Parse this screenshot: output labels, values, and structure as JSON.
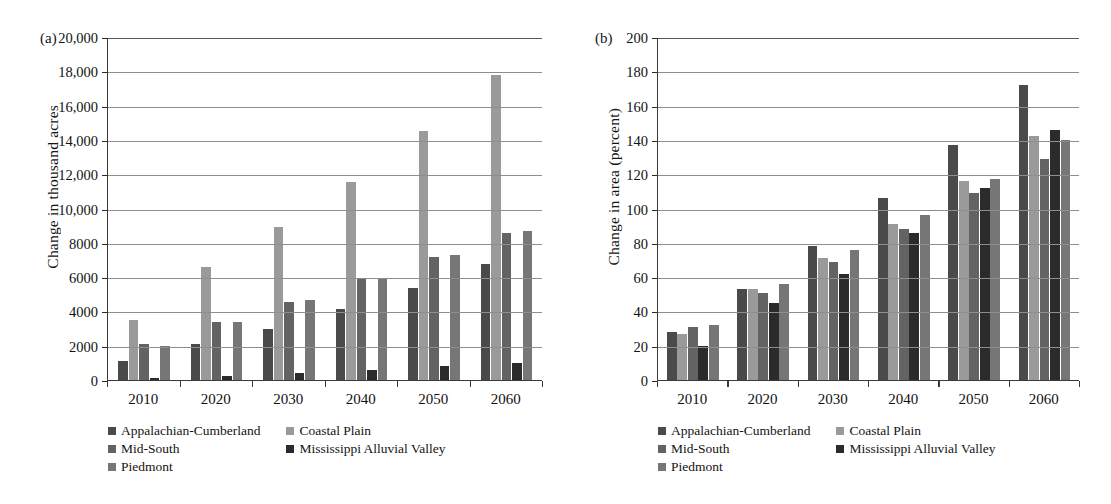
{
  "figure": {
    "background": "#ffffff",
    "series_colors": [
      "#4a4a4a",
      "#9a9a9a",
      "#636363",
      "#2b2b2b",
      "#767676"
    ],
    "series_names": [
      "Appalachian-Cumberland",
      "Coastal Plain",
      "Mid-South",
      "Mississippi Alluvial Valley",
      "Piedmont"
    ]
  },
  "legend": {
    "items": [
      {
        "label": "Appalachian-Cumberland",
        "color": "#4a4a4a"
      },
      {
        "label": "Coastal Plain",
        "color": "#9a9a9a"
      },
      {
        "label": "Mid-South",
        "color": "#636363"
      },
      {
        "label": "Mississippi Alluvial Valley",
        "color": "#2b2b2b"
      },
      {
        "label": "Piedmont",
        "color": "#767676"
      }
    ]
  },
  "chart_data": [
    {
      "panel": "(a)",
      "type": "bar",
      "title": "",
      "xlabel": "",
      "ylabel": "Change in thousand acres",
      "categories": [
        "2010",
        "2020",
        "2030",
        "2040",
        "2050",
        "2060"
      ],
      "ylim": [
        0,
        20000
      ],
      "yticks": [
        0,
        2000,
        4000,
        6000,
        8000,
        10000,
        12000,
        14000,
        16000,
        18000,
        20000
      ],
      "ytick_labels": [
        "0",
        "2000",
        "4000",
        "6000",
        "8000",
        "10,000",
        "12,000",
        "14,000",
        "16,000",
        "18,000",
        "20,000"
      ],
      "grid": true,
      "legend_position": "below",
      "series": [
        {
          "name": "Appalachian-Cumberland",
          "color": "#4a4a4a",
          "values": [
            1100,
            2080,
            3000,
            4150,
            5350,
            6750
          ]
        },
        {
          "name": "Coastal Plain",
          "color": "#9a9a9a",
          "values": [
            3500,
            6600,
            8950,
            11550,
            14500,
            17800
          ]
        },
        {
          "name": "Mid-South",
          "color": "#636363",
          "values": [
            2100,
            3400,
            4550,
            5900,
            7200,
            8550
          ]
        },
        {
          "name": "Mississippi Alluvial Valley",
          "color": "#2b2b2b",
          "values": [
            100,
            230,
            420,
            570,
            800,
            1000
          ]
        },
        {
          "name": "Piedmont",
          "color": "#767676",
          "values": [
            2000,
            3400,
            4650,
            5950,
            7300,
            8700
          ]
        }
      ]
    },
    {
      "panel": "(b)",
      "type": "bar",
      "title": "",
      "xlabel": "",
      "ylabel": "Change in area (percent)",
      "categories": [
        "2010",
        "2020",
        "2030",
        "2040",
        "2050",
        "2060"
      ],
      "ylim": [
        0,
        200
      ],
      "yticks": [
        0,
        20,
        40,
        60,
        80,
        100,
        120,
        140,
        160,
        180,
        200
      ],
      "ytick_labels": [
        "0",
        "20",
        "40",
        "60",
        "80",
        "100",
        "120",
        "140",
        "160",
        "180",
        "200"
      ],
      "grid": true,
      "legend_position": "below",
      "series": [
        {
          "name": "Appalachian-Cumberland",
          "color": "#4a4a4a",
          "values": [
            28,
            53,
            78,
            106,
            137,
            172
          ]
        },
        {
          "name": "Coastal Plain",
          "color": "#9a9a9a",
          "values": [
            27,
            53,
            71,
            91,
            116,
            142
          ]
        },
        {
          "name": "Mid-South",
          "color": "#636363",
          "values": [
            31,
            51,
            69,
            88,
            109,
            129
          ]
        },
        {
          "name": "Mississippi Alluvial Valley",
          "color": "#2b2b2b",
          "values": [
            20,
            45,
            62,
            86,
            112,
            146
          ]
        },
        {
          "name": "Piedmont",
          "color": "#767676",
          "values": [
            32,
            56,
            76,
            96,
            117,
            140
          ]
        }
      ]
    }
  ]
}
